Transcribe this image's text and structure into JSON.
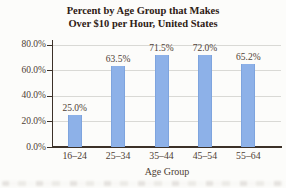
{
  "title_lines": [
    "Percent by Age Group that Makes",
    "Over $10 per Hour, United States"
  ],
  "chart_data": {
    "type": "bar",
    "title": "Percent by Age Group that Makes Over $10 per Hour, United States",
    "categories": [
      "16–24",
      "25–34",
      "35–44",
      "45–54",
      "55–64"
    ],
    "values": [
      25.0,
      63.5,
      71.5,
      72.0,
      65.2
    ],
    "data_labels": [
      "25.0%",
      "63.5%",
      "71.5%",
      "72.0%",
      "65.2%"
    ],
    "xlabel": "Age Group",
    "ylabel": "",
    "ylim": [
      0,
      80
    ],
    "ytick_step": 20,
    "ytick_labels": [
      "0.0%",
      "20.0%",
      "40.0%",
      "60.0%",
      "80.0%"
    ],
    "grid": true,
    "legend": false,
    "colors": {
      "bar": "#8db1e8",
      "bar_edge": "#7ea4de",
      "title_text": "#2e2014",
      "label_text": "#4e4034",
      "gridline": "#d9d9d5",
      "axis": "#3c3128",
      "background": "#fcfcfa"
    }
  }
}
